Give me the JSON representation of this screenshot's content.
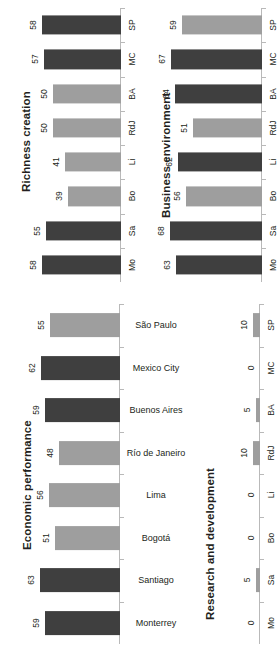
{
  "figure": {
    "orientation": "rotated-90",
    "colors": {
      "dark_bar": "#3f3f3f",
      "light_bar": "#9e9e9e",
      "axis": "#b9b9b9",
      "text": "#231f20"
    }
  },
  "chart_data": [
    {
      "type": "bar",
      "title": "Richness creation",
      "xlabel": "",
      "ylabel": "",
      "categories": [
        "SP",
        "MC",
        "BA",
        "RdJ",
        "Li",
        "Bo",
        "Sa",
        "Mo"
      ],
      "values": [
        58,
        57,
        50,
        50,
        41,
        39,
        55,
        58
      ],
      "bar_colors": [
        "dark",
        "dark",
        "light",
        "light",
        "light",
        "light",
        "dark",
        "dark"
      ],
      "ylim": [
        0,
        70
      ],
      "grid": false,
      "legend": "none"
    },
    {
      "type": "bar",
      "title": "Business environment",
      "xlabel": "",
      "ylabel": "",
      "categories": [
        "SP",
        "MC",
        "BA",
        "RdJ",
        "Li",
        "Bo",
        "Sa",
        "Mo"
      ],
      "values": [
        59,
        67,
        64,
        51,
        62,
        56,
        68,
        63
      ],
      "bar_colors": [
        "light",
        "dark",
        "dark",
        "light",
        "dark",
        "light",
        "dark",
        "dark"
      ],
      "ylim": [
        0,
        70
      ],
      "grid": false,
      "legend": "none"
    },
    {
      "type": "bar",
      "title": "Economic performance",
      "xlabel": "",
      "ylabel": "",
      "categories": [
        "São Paulo",
        "Mexico City",
        "Buenos Aires",
        "Río de Janeiro",
        "Lima",
        "Bogotá",
        "Santiago",
        "Monterrey"
      ],
      "values": [
        55,
        62,
        59,
        48,
        56,
        51,
        63,
        59
      ],
      "bar_colors": [
        "light",
        "dark",
        "dark",
        "light",
        "light",
        "light",
        "dark",
        "dark"
      ],
      "ylim": [
        0,
        70
      ],
      "grid": false,
      "legend": "none"
    },
    {
      "type": "bar",
      "title": "Research and development",
      "xlabel": "",
      "ylabel": "",
      "categories": [
        "SP",
        "MC",
        "BA",
        "RdJ",
        "Li",
        "Bo",
        "Sa",
        "Mo"
      ],
      "values": [
        10,
        0,
        5,
        10,
        0,
        0,
        5,
        0
      ],
      "bar_colors": [
        "light",
        "light",
        "light",
        "light",
        "light",
        "light",
        "light",
        "light"
      ],
      "ylim": [
        0,
        70
      ],
      "grid": false,
      "legend": "none"
    }
  ],
  "panels": {
    "richness": {
      "title": "Richness creation",
      "labels": [
        "SP",
        "MC",
        "BA",
        "RdJ",
        "Li",
        "Bo",
        "Sa",
        "Mo"
      ],
      "values": [
        "58",
        "57",
        "50",
        "50",
        "41",
        "39",
        "55",
        "58"
      ]
    },
    "business": {
      "title": "Business environment",
      "labels": [
        "SP",
        "MC",
        "BA",
        "RdJ",
        "Li",
        "Bo",
        "Sa",
        "Mo"
      ],
      "values": [
        "59",
        "67",
        "64",
        "51",
        "62",
        "56",
        "68",
        "63"
      ]
    },
    "economic": {
      "title": "Economic performance",
      "labels": [
        "São Paulo",
        "Mexico City",
        "Buenos Aires",
        "Río de Janeiro",
        "Lima",
        "Bogotá",
        "Santiago",
        "Monterrey"
      ],
      "values": [
        "55",
        "62",
        "59",
        "48",
        "56",
        "51",
        "63",
        "59"
      ]
    },
    "research": {
      "title": "Research and development",
      "labels": [
        "SP",
        "MC",
        "BA",
        "RdJ",
        "Li",
        "Bo",
        "Sa",
        "Mo"
      ],
      "values": [
        "10",
        "0",
        "5",
        "10",
        "0",
        "0",
        "5",
        "0"
      ]
    }
  }
}
